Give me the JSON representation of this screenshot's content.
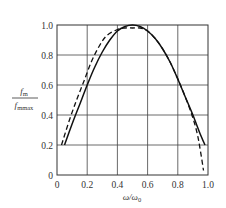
{
  "chart_data": {
    "type": "line",
    "title": "",
    "xlabel": "ω/ω₀",
    "ylabel": "f_m / f_mmax",
    "ylabel_num": "f",
    "ylabel_num_sub": "m",
    "ylabel_den": "f",
    "ylabel_den_sub": "mmax",
    "xlabel_main": "ω/ω",
    "xlabel_sub": "0",
    "xlim": [
      0,
      1.0
    ],
    "ylim": [
      0,
      1.0
    ],
    "grid": true,
    "legend": null,
    "x_ticks": [
      "0",
      "0.2",
      "0.4",
      "0.6",
      "0.8",
      "1.0"
    ],
    "y_ticks": [
      "0",
      "0.2",
      "0.4",
      "0.6",
      "0.8",
      "1.0"
    ],
    "series": [
      {
        "name": "solid",
        "style": "solid",
        "x": [
          0.05,
          0.1,
          0.15,
          0.2,
          0.25,
          0.3,
          0.35,
          0.4,
          0.45,
          0.5,
          0.55,
          0.6,
          0.65,
          0.7,
          0.75,
          0.8,
          0.85,
          0.9,
          0.95,
          0.98
        ],
        "y": [
          0.2,
          0.34,
          0.47,
          0.6,
          0.72,
          0.82,
          0.9,
          0.96,
          0.99,
          1.0,
          0.99,
          0.96,
          0.91,
          0.84,
          0.75,
          0.64,
          0.52,
          0.4,
          0.27,
          0.2
        ]
      },
      {
        "name": "dashed",
        "style": "dashed",
        "x": [
          0.03,
          0.08,
          0.13,
          0.18,
          0.23,
          0.28,
          0.33,
          0.4,
          0.45,
          0.5,
          0.55,
          0.6,
          0.65,
          0.7,
          0.75,
          0.8,
          0.85,
          0.9,
          0.93,
          0.95,
          0.97
        ],
        "y": [
          0.2,
          0.36,
          0.5,
          0.63,
          0.76,
          0.86,
          0.93,
          0.97,
          0.98,
          0.98,
          0.98,
          0.96,
          0.91,
          0.84,
          0.75,
          0.64,
          0.52,
          0.38,
          0.27,
          0.16,
          0.03
        ]
      }
    ]
  },
  "colors": {
    "axis": "#333333",
    "grid": "#444444",
    "curve": "#111111"
  }
}
